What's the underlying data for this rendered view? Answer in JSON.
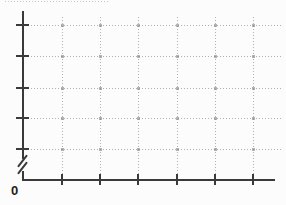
{
  "chart_data": {
    "type": "line",
    "title": "",
    "xlabel": "",
    "ylabel": "",
    "series": [],
    "origin_label": "0",
    "x_axis": {
      "tick_count": 6,
      "tick_labels": [
        "",
        "",
        "",
        "",
        "",
        ""
      ],
      "gridlines": "dotted"
    },
    "y_axis": {
      "tick_count": 5,
      "tick_labels": [
        "",
        "",
        "",
        "",
        ""
      ],
      "gridlines": "dotted",
      "axis_break_near_origin": true
    }
  },
  "colors": {
    "background": "#fcfcfc",
    "axis": "#3a3a3a",
    "grid": "#b0b0b0",
    "grid_intersection": "#8c8c8c",
    "label": "#1e1e1e",
    "artifact": "#c9c9c9"
  },
  "geometry": {
    "width": 286,
    "height": 205,
    "y_axis": {
      "x": 23,
      "top": 11,
      "break_top": 159,
      "break_bottom": 171,
      "bottom": 181
    },
    "x_axis": {
      "y": 180,
      "left": 22,
      "right": 275
    },
    "grid": {
      "v": [
        62,
        100,
        138,
        177,
        215,
        253
      ],
      "h": [
        25,
        56,
        88,
        118,
        149
      ],
      "top": 17,
      "right": 283
    },
    "y_ticks": {
      "x1": 16,
      "x2": 29
    },
    "x_ticks": {
      "y1": 174,
      "y2": 185
    },
    "break_mark": {
      "cx": 22,
      "len": 15,
      "angle_deg": -52,
      "y1": 160,
      "y2": 167
    },
    "origin": {
      "x": 11,
      "y": 184
    },
    "artifact": {
      "y": 1,
      "x1": 5,
      "x2": 108
    }
  }
}
